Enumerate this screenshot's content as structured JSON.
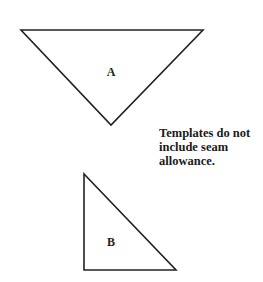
{
  "diagram": {
    "pieces": [
      {
        "id": "A",
        "label": "A",
        "shape": "triangle",
        "orientation": "inverted isosceles",
        "points": "21,30 203,30 111,125",
        "label_pos": {
          "x": 111,
          "y": 76
        }
      },
      {
        "id": "B",
        "label": "B",
        "shape": "triangle",
        "orientation": "right triangle",
        "points": "84,174 84,270 176,270",
        "label_pos": {
          "x": 111,
          "y": 246
        }
      }
    ],
    "note": {
      "lines": [
        "Templates do not",
        "include seam",
        "allowance."
      ]
    },
    "colors": {
      "stroke": "#222222",
      "background": "#ffffff",
      "text": "#1a1a1a"
    }
  }
}
